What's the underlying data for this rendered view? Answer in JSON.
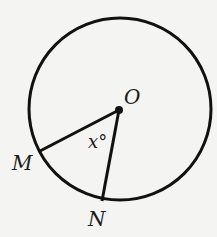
{
  "diagram": {
    "type": "circle-central-angle",
    "circle": {
      "cx": 120,
      "cy": 109,
      "r": 91
    },
    "points": {
      "O": {
        "label": "O",
        "x": 119,
        "y": 109
      },
      "M": {
        "label": "M",
        "x": 40,
        "y": 151
      },
      "N": {
        "label": "N",
        "x": 102,
        "y": 201
      }
    },
    "angle_label": "x°",
    "segments": [
      "OM",
      "ON"
    ],
    "colors": {
      "stroke": "#111111",
      "background": "#f4f4f2"
    }
  }
}
